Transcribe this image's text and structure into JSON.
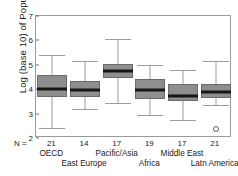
{
  "chart_data": {
    "type": "box",
    "title": "",
    "xlabel": "",
    "ylabel": "Log (base 10) of Population",
    "ylim": [
      2,
      7
    ],
    "yticks": [
      7,
      6,
      5,
      4,
      3,
      2
    ],
    "grid": false,
    "legend": "none",
    "n_prefix": "N =",
    "categories": [
      "OECD",
      "East Europe",
      "Pacific/Asia",
      "Africa",
      "Middle East",
      "Latn America"
    ],
    "counts": [
      21,
      14,
      17,
      19,
      17,
      21
    ],
    "boxes": [
      {
        "category": "OECD",
        "n": 21,
        "whisker_low": 2.4,
        "q1": 3.7,
        "median": 4.0,
        "q3": 4.6,
        "whisker_high": 5.4,
        "outliers": []
      },
      {
        "category": "East Europe",
        "n": 14,
        "whisker_low": 3.2,
        "q1": 3.7,
        "median": 3.97,
        "q3": 4.35,
        "whisker_high": 5.15,
        "outliers": []
      },
      {
        "category": "Pacific/Asia",
        "n": 17,
        "whisker_low": 3.45,
        "q1": 4.45,
        "median": 4.75,
        "q3": 5.05,
        "whisker_high": 6.05,
        "outliers": []
      },
      {
        "category": "Africa",
        "n": 19,
        "whisker_low": 2.95,
        "q1": 3.6,
        "median": 3.95,
        "q3": 4.4,
        "whisker_high": 5.0,
        "outliers": []
      },
      {
        "category": "Middle East",
        "n": 17,
        "whisker_low": 2.72,
        "q1": 3.5,
        "median": 3.72,
        "q3": 4.2,
        "whisker_high": 4.8,
        "outliers": []
      },
      {
        "category": "Latn America",
        "n": 21,
        "whisker_low": 3.35,
        "q1": 3.65,
        "median": 3.87,
        "q3": 4.2,
        "whisker_high": 5.15,
        "outliers": [
          2.35
        ]
      }
    ],
    "colors": {
      "box_fill": "#8e8e8e",
      "box_edge": "#6b6b6b",
      "median": "#161616",
      "whisker": "#9c9c9c",
      "frame": "#9a9a9a",
      "text": "#1a1a1a"
    }
  }
}
